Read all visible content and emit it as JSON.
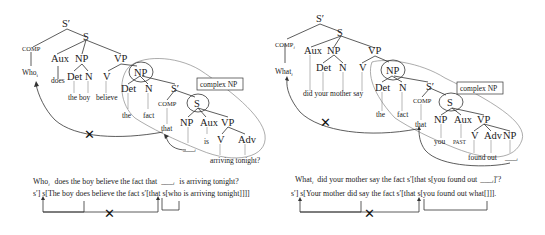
{
  "left_tree": {
    "nodes": {
      "sbar_root": "S′",
      "s_root": "S",
      "comp": "COMP",
      "aux": "Aux",
      "np_subj": "NP",
      "vp": "VP",
      "det1": "Det",
      "n1": "N",
      "v1": "V",
      "np_obj": "NP",
      "det2": "Det",
      "n2": "N",
      "sbar_emb": "S′",
      "comp2": "COMP",
      "s_emb": "S",
      "np_emb": "NP",
      "aux_emb": "Aux",
      "vp_emb": "VP",
      "v_emb": "V",
      "adv_emb": "Adv"
    },
    "words": {
      "who": "Who",
      "who_sub": "i",
      "does": "does",
      "the_boy": "the boy",
      "believe": "believe",
      "the": "the",
      "fact": "fact",
      "that": "that",
      "gap": "___",
      "gap_sub": "i",
      "is": "is",
      "arriving_tonight": "arriving tonight?"
    },
    "label_box": "complex NP",
    "sentence1_head": "Who",
    "sentence1_sub": "i",
    "sentence1_rest": "does  the  boy believe the fact that",
    "sentence1_gap": "___",
    "sentence1_gap_sub": "i",
    "sentence1_tail": "is   arriving    tonight?",
    "sentence2": "s′] s[The boy does believe the fact s′[that s[who is arriving tonight]]]]",
    "blocked_mark": "✕"
  },
  "right_tree": {
    "nodes": {
      "sbar_root": "S′",
      "s_root": "S",
      "comp": "COMP",
      "comp_sub": "i",
      "aux": "Aux",
      "np_subj": "NP",
      "vp": "VP",
      "det1": "Det",
      "n1": "N",
      "v1": "V",
      "np_obj": "NP",
      "det2": "Det",
      "n2": "N",
      "sbar_emb": "S′",
      "comp2": "COMP",
      "s_emb": "S",
      "np_emb": "NP",
      "aux_emb": "Aux",
      "vp_emb": "VP",
      "v_emb": "V",
      "adv_emb": "Adv",
      "np_emb2": "NP"
    },
    "words": {
      "what": "What",
      "what_sub": "i",
      "did_your_mother_say": "did your mother say",
      "the": "the",
      "fact": "fact",
      "that": "that",
      "you": "you",
      "past": "PAST",
      "found_out": "found out",
      "gap": "___",
      "gap_sub": "i"
    },
    "label_box": "complex NP",
    "sentence1_head": "What",
    "sentence1_sub": "i",
    "sentence1_rest": "did  your mother say the fact s′[that s[you found out",
    "sentence1_gap": "___",
    "sentence1_gap_sub": "i",
    "sentence1_tail": "]′?",
    "sentence2": "s′]   s[Your mother did say the fact s′[that s[you found out what[]]].",
    "blocked_mark": "✕"
  }
}
